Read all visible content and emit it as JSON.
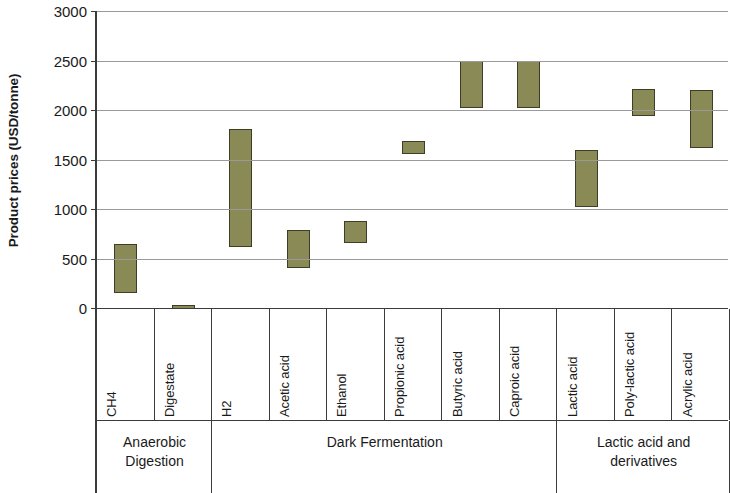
{
  "chart_data": {
    "type": "bar",
    "subtype": "floating-range-bar",
    "title": "",
    "xlabel": "",
    "ylabel": "Product prices (USD/tonne)",
    "ylim": [
      0,
      3000
    ],
    "yticks": [
      0,
      500,
      1000,
      1500,
      2000,
      2500,
      3000
    ],
    "ytick_labels": [
      "0",
      "500",
      "1000",
      "1500",
      "2000",
      "2500",
      "3000"
    ],
    "grid": true,
    "legend": "none",
    "bar_color": "#8a8a57",
    "bar_border_color": "#3e3e28",
    "gridline_color": "#9a9a9a",
    "axis_color": "#3b3b3b",
    "categories": [
      "CH4",
      "Digestate",
      "H2",
      "Acetic acid",
      "Ethanol",
      "Propionic acid",
      "Butyric acid",
      "Caproic acid",
      "Lactic acid",
      "Poly-lactic acid",
      "Acrylic acid"
    ],
    "ranges": [
      {
        "category": "CH4",
        "low": 150,
        "high": 650
      },
      {
        "category": "Digestate",
        "low": 0,
        "high": 30
      },
      {
        "category": "H2",
        "low": 620,
        "high": 1810
      },
      {
        "category": "Acetic acid",
        "low": 400,
        "high": 790
      },
      {
        "category": "Ethanol",
        "low": 660,
        "high": 880
      },
      {
        "category": "Propionic acid",
        "low": 1560,
        "high": 1690
      },
      {
        "category": "Butyric acid",
        "low": 2020,
        "high": 2500
      },
      {
        "category": "Caproic acid",
        "low": 2020,
        "high": 2500
      },
      {
        "category": "Lactic acid",
        "low": 1020,
        "high": 1600
      },
      {
        "category": "Poly-lactic acid",
        "low": 1940,
        "high": 2210
      },
      {
        "category": "Acrylic acid",
        "low": 1620,
        "high": 2200
      }
    ],
    "groups": [
      {
        "label": "Anaerobic\nDigestion",
        "categories": [
          "CH4",
          "Digestate"
        ]
      },
      {
        "label": "Dark Fermentation",
        "categories": [
          "H2",
          "Acetic acid",
          "Ethanol",
          "Propionic acid",
          "Butyric acid",
          "Caproic acid"
        ]
      },
      {
        "label": "Lactic acid and\nderivatives",
        "categories": [
          "Lactic acid",
          "Poly-lactic acid",
          "Acrylic acid"
        ]
      }
    ]
  }
}
